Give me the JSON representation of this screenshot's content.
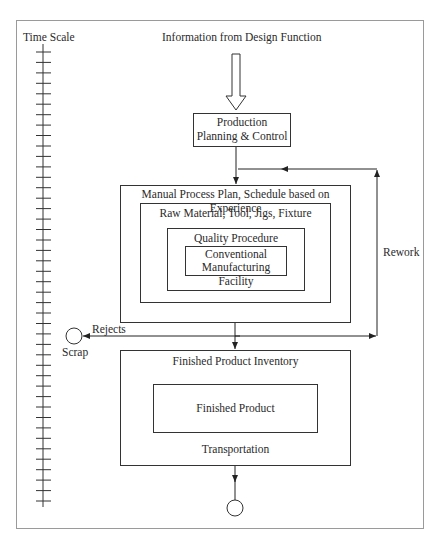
{
  "diagram": {
    "frame_label": "Time Scale",
    "input_label": "Information from Design Function",
    "nodes": {
      "ppc": {
        "line1": "Production",
        "line2": "Planning & Control"
      },
      "process_plan": "Manual Process Plan, Schedule based on Experience",
      "raw_material": "Raw Material, Tool, Jigs, Fixture",
      "quality": "Quality Procedure",
      "facility": {
        "line1": "Conventional",
        "line2": "Manufacturing Facility"
      },
      "inventory": "Finished Product Inventory",
      "finished_product": "Finished Product",
      "transportation": "Transportation",
      "scrap": "Scrap"
    },
    "edges": {
      "rework": "Rework",
      "rejects": "Rejects"
    },
    "time_scale": {
      "tick_count": 44
    },
    "colors": {
      "line": "#222222",
      "frame": "#9a9a9a",
      "background": "#ffffff"
    }
  }
}
